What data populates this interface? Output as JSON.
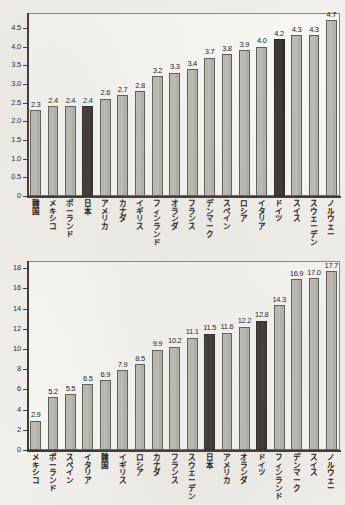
{
  "figure": {
    "background_color": "#f1efeb",
    "plot_background_color": "#f7f6f3",
    "bar_color_default": "#b8b7af",
    "bar_color_highlight": "#3a3431",
    "axis_color": "#3c3936"
  },
  "chart_data": [
    {
      "type": "bar",
      "title": "",
      "subtitle": "",
      "xlabel": "",
      "ylabel": "",
      "ylim": [
        0,
        4.9
      ],
      "ytick_labels": [
        "0",
        "0.5",
        "1.0",
        "1.5",
        "2.0",
        "2.5",
        "3.0",
        "3.5",
        "4.0",
        "4.5"
      ],
      "ytick_values": [
        0,
        0.5,
        1.0,
        1.5,
        2.0,
        2.5,
        3.0,
        3.5,
        4.0,
        4.5
      ],
      "grid": false,
      "legend": "none",
      "categories": [
        "韓国",
        "メキシコ",
        "ポーランド",
        "日本",
        "アメリカ",
        "カナダ",
        "イギリス",
        "フィンランド",
        "オランダ",
        "フランス",
        "デンマーク",
        "スペイン",
        "ロシア",
        "イタリア",
        "ドイツ",
        "スイス",
        "スウェーデン",
        "ノルウェー"
      ],
      "values": [
        2.3,
        2.4,
        2.4,
        2.4,
        2.6,
        2.7,
        2.8,
        3.2,
        3.3,
        3.4,
        3.7,
        3.8,
        3.9,
        4.0,
        4.2,
        4.3,
        4.3,
        4.7
      ],
      "data_labels": [
        "2.3",
        "2.4",
        "2.4",
        "2.4",
        "2.6",
        "2.7",
        "2.8",
        "3.2",
        "3.3",
        "3.4",
        "3.7",
        "3.8",
        "3.9",
        "4.0",
        "4.2",
        "4.3",
        "4.3",
        "4.7"
      ],
      "highlighted": [
        false,
        false,
        false,
        true,
        false,
        false,
        false,
        false,
        false,
        false,
        false,
        false,
        false,
        false,
        true,
        false,
        false,
        false
      ]
    },
    {
      "type": "bar",
      "title": "",
      "subtitle": "",
      "xlabel": "",
      "ylabel": "",
      "ylim": [
        0,
        18.7
      ],
      "ytick_labels": [
        "0",
        "2",
        "4",
        "6",
        "8",
        "10",
        "12",
        "14",
        "16",
        "18"
      ],
      "ytick_values": [
        0,
        2,
        4,
        6,
        8,
        10,
        12,
        14,
        16,
        18
      ],
      "grid": false,
      "legend": "none",
      "categories": [
        "メキシコ",
        "ポーランド",
        "スペイン",
        "イタリア",
        "韓国",
        "イギリス",
        "ロシア",
        "カナダ",
        "フランス",
        "スウェーデン",
        "日本",
        "アメリカ",
        "オランダ",
        "ドイツ",
        "フィンランド",
        "デンマーク",
        "スイス",
        "ノルウェー"
      ],
      "values": [
        2.9,
        5.2,
        5.5,
        6.5,
        6.9,
        7.9,
        8.5,
        9.9,
        10.2,
        11.1,
        11.5,
        11.6,
        12.2,
        12.8,
        14.3,
        16.9,
        17.0,
        17.7
      ],
      "data_labels": [
        "2.9",
        "5.2",
        "5.5",
        "6.5",
        "6.9",
        "7.9",
        "8.5",
        "9.9",
        "10.2",
        "11.1",
        "11.5",
        "11.6",
        "12.2",
        "12.8",
        "14.3",
        "16.9",
        "17.0",
        "17.7"
      ],
      "highlighted": [
        false,
        false,
        false,
        false,
        false,
        false,
        false,
        false,
        false,
        false,
        true,
        false,
        false,
        true,
        false,
        false,
        false,
        false
      ]
    }
  ]
}
